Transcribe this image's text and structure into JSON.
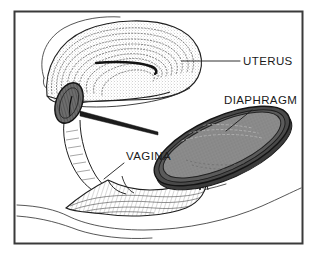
{
  "figure": {
    "style": "black-and-white line drawing with stipple shading",
    "frame": {
      "name": "figure-border",
      "color": "#3a3a3a",
      "x": 14,
      "y": 11,
      "width": 289,
      "height": 233
    },
    "background_color": "#ffffff",
    "ink_color": "#1a1a1a",
    "shade_color": "#8a8a8a",
    "rim_color": "#4a4a4a",
    "dark_color": "#555555"
  },
  "labels": [
    {
      "id": "uterus",
      "text": "UTERUS",
      "text_x": 243,
      "text_y": 65,
      "leader": "M 182 61 L 240 61",
      "points_to": "uterine body / myometrium"
    },
    {
      "id": "diaphragm",
      "text": "DIAPHRAGM",
      "text_x": 224,
      "text_y": 104,
      "leader": "M 252 110 L 226 131",
      "points_to": "diaphragm dome rim"
    },
    {
      "id": "vagina",
      "text": "VAGINA",
      "text_x": 126,
      "text_y": 160,
      "leader": "M 124 163 L 104 179",
      "points_to": "vaginal canal / introitus"
    }
  ],
  "structures": [
    {
      "id": "uterus-body",
      "name": "uterus",
      "description": "Large anteverted uterus, stippled myometrial layers with central endometrial cavity line",
      "fill": "#ffffff",
      "texture": "concentric stipple arcs"
    },
    {
      "id": "cervix",
      "name": "cervix",
      "description": "Dark ovoid cervix seated within the diaphragm rim",
      "fill": "#6d6d6d"
    },
    {
      "id": "vaginal-canal",
      "name": "vagina",
      "description": "Narrow vaginal canal descending from cervix to perineum",
      "fill": "#ffffff"
    },
    {
      "id": "diaphragm-device",
      "name": "diaphragm",
      "description": "Tilted elliptical contraceptive diaphragm with thick flexible rim and stippled dome",
      "dome_fill": "#8a8a8a",
      "rim_fill": "#4a4a4a",
      "angle_degrees": -24
    },
    {
      "id": "perineum",
      "name": "perineal body and pelvic floor",
      "description": "Hatched wedge of pelvic floor tissue below the vagina",
      "fill": "#ffffff",
      "texture": "fine hatching"
    },
    {
      "id": "body-contour",
      "name": "abdominal and perineal contour lines",
      "description": "Thin free outline curves of the body wall"
    }
  ]
}
